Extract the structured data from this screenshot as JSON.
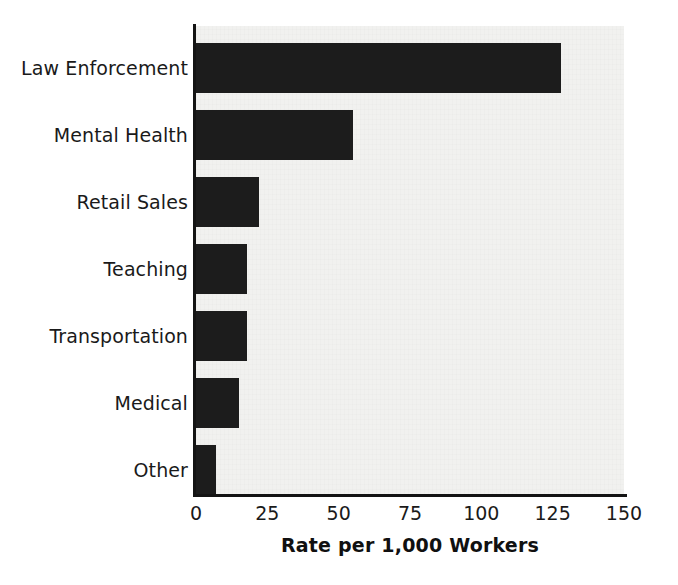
{
  "chart_data": {
    "type": "bar",
    "orientation": "horizontal",
    "title": "",
    "xlabel": "Rate per 1,000 Workers",
    "ylabel": "",
    "categories": [
      "Law Enforcement",
      "Mental Health",
      "Retail Sales",
      "Teaching",
      "Transportation",
      "Medical",
      "Other"
    ],
    "values": [
      128,
      55,
      22,
      18,
      18,
      15,
      7
    ],
    "xlim": [
      0,
      150
    ],
    "xticks": [
      0,
      25,
      50,
      75,
      100,
      125,
      150
    ],
    "xtick_labels": [
      "0",
      "25",
      "50",
      "75",
      "100",
      "125",
      "150"
    ],
    "grid": false,
    "legend": false,
    "bar_color": "#1c1c1c",
    "plot_background": "#f1f1ef",
    "axis_color": "#141414"
  },
  "axis": {
    "x_title": "Rate per 1,000 Workers"
  }
}
